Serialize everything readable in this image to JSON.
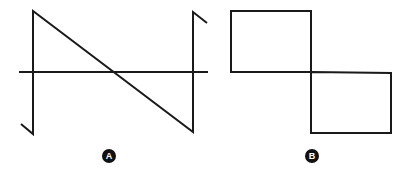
{
  "figures": [
    {
      "id": "A",
      "label": "A",
      "description": "Sawtooth waveform crossing a horizontal axis",
      "stroke_color": "#1a1a1a"
    },
    {
      "id": "B",
      "label": "B",
      "description": "Square waveform drawn as two offset rectangles",
      "stroke_color": "#1a1a1a"
    }
  ],
  "colors": {
    "background": "#ffffff",
    "line": "#1a1a1a",
    "badge_fill": "#111111",
    "badge_text": "#ffffff"
  }
}
